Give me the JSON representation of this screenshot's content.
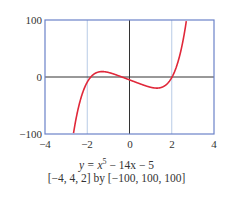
{
  "chart_data": {
    "type": "line",
    "title": "",
    "function": "y = x^5 - 14x - 5",
    "caption_equation": "y = x⁵ − 14x − 5",
    "window": "[−4, 4, 2] by [−100, 100, 100]",
    "xlim": [
      -4,
      4
    ],
    "ylim": [
      -100,
      100
    ],
    "xscale": 2,
    "yscale": 100,
    "x_ticks": [
      "−4",
      "−2",
      "0",
      "2",
      "4"
    ],
    "y_ticks": [
      "100",
      "0",
      "−100"
    ],
    "grid": true,
    "series": [
      {
        "name": "y = x^5 - 14x - 5",
        "color": "#e0283a",
        "x": [
          -2.65,
          -2.5,
          -2.25,
          -2.0,
          -1.75,
          -1.5,
          -1.25,
          -1.0,
          -0.5,
          0,
          0.5,
          1.0,
          1.25,
          1.5,
          1.75,
          2.0,
          2.25,
          2.5,
          2.7
        ],
        "y": [
          -95.6,
          -67.7,
          -31.2,
          -9.0,
          3.1,
          8.4,
          9.4,
          8.0,
          1.97,
          -5.0,
          -11.97,
          -18.0,
          -19.4,
          -18.4,
          -13.1,
          -1.0,
          21.2,
          57.7,
          100.5
        ]
      }
    ]
  },
  "labels": {
    "y_top": "100",
    "y_mid": "0",
    "y_bottom": "−100",
    "x0": "−4",
    "x1": "−2",
    "x2": "0",
    "x3": "2",
    "x4": "4",
    "caption_prefix": "y = x",
    "caption_exp": "5",
    "caption_suffix": " − 14x − 5",
    "window": "[−4, 4, 2] by [−100, 100, 100]"
  },
  "colors": {
    "frame": "#6b82c9",
    "grid": "#b8cbe6",
    "axis": "#333333",
    "curve": "#e0283a"
  }
}
